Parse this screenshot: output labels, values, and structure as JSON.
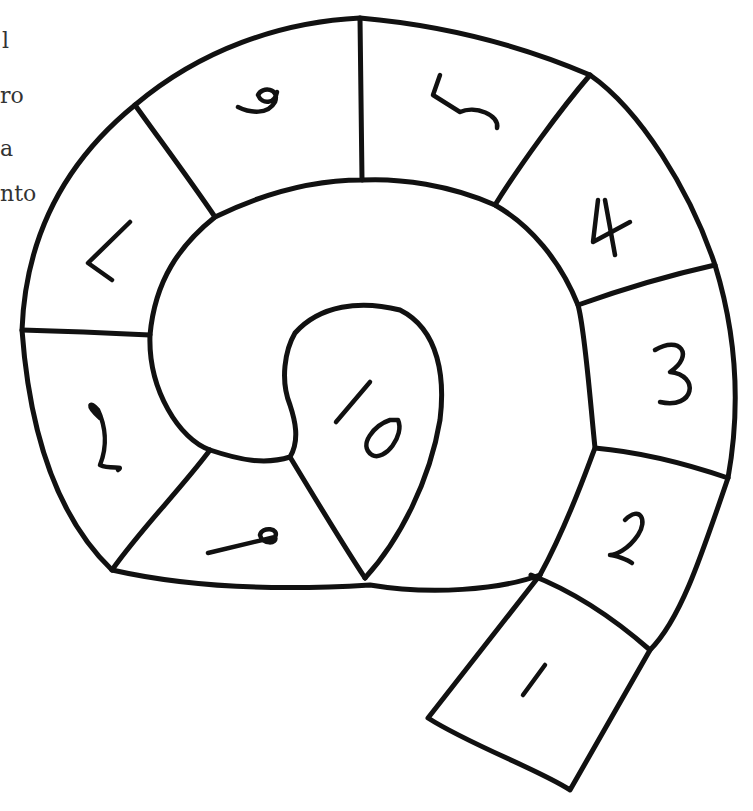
{
  "page": {
    "background": "#ffffff",
    "ink_color": "#111111"
  },
  "clipped_text_lines": [
    {
      "text": "l",
      "top": 30
    },
    {
      "text": "ro",
      "top": 85
    },
    {
      "text": "a",
      "top": 138
    },
    {
      "text": "nto",
      "top": 183
    }
  ],
  "board": {
    "type": "spiral-game-board",
    "squares": [
      {
        "label": "1"
      },
      {
        "label": "2"
      },
      {
        "label": "3"
      },
      {
        "label": "4"
      },
      {
        "label": "5"
      },
      {
        "label": "6"
      },
      {
        "label": "7"
      },
      {
        "label": "8"
      },
      {
        "label": "9"
      },
      {
        "label": "10"
      }
    ]
  }
}
